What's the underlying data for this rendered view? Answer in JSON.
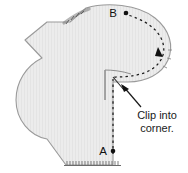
{
  "figure": {
    "name": "clip-into-corner-sewing-diagram",
    "width": 188,
    "height": 173,
    "background_color": "#ffffff"
  },
  "fabric": {
    "fill_color": "#ebebeb",
    "outline_color": "#8a8a8a",
    "texture": "fine vertical stripes"
  },
  "labels": {
    "point_a": "A",
    "point_b": "B",
    "callout_line1": "Clip into",
    "callout_line2": "corner."
  },
  "annotations": {
    "stitch_line_color": "#1a1a1a",
    "stitch_style": "dashed",
    "direction_arrow": "triangle-arrowhead-pointing-down",
    "callout_arrow": "arrow-pointing-up-left",
    "clip_mark": "diagonal-clip-into-inner-corner"
  }
}
